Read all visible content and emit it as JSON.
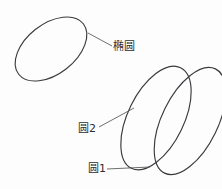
{
  "figure": {
    "background_color": "#fdfdfd",
    "stroke_color": "#3a3a3f",
    "leader_color": "#55555a",
    "width": 222,
    "height": 189
  },
  "labels": {
    "ellipse": "椭圆",
    "circle2": "圆2",
    "circle1": "圆1"
  },
  "chart_data": {
    "type": "diagram",
    "title": "",
    "shapes": [
      {
        "name": "ellipse",
        "label": "椭圆",
        "cx": 51,
        "cy": 49,
        "rx": 41,
        "ry": 25,
        "rotation_deg": -38
      },
      {
        "name": "circle2",
        "label": "圆2",
        "cx": 156,
        "cy": 118,
        "rx": 56,
        "ry": 28,
        "rotation_deg": -64
      },
      {
        "name": "circle1",
        "label": "圆1",
        "cx": 190,
        "cy": 121,
        "rx": 58,
        "ry": 28,
        "rotation_deg": -64
      }
    ],
    "leaders": [
      {
        "for": "椭圆",
        "x1": 88,
        "y1": 33,
        "x2": 112,
        "y2": 46
      },
      {
        "for": "圆2",
        "x1": 99,
        "y1": 127,
        "x2": 134,
        "y2": 108
      },
      {
        "for": "圆1",
        "x1": 107,
        "y1": 169,
        "x2": 150,
        "y2": 167
      }
    ]
  }
}
